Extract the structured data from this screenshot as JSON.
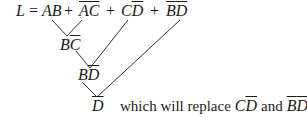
{
  "equation": {
    "lhs": "L",
    "equals": "=",
    "terms": [
      {
        "id": "t1",
        "parts": [
          {
            "v": "A",
            "bar": false
          },
          {
            "v": "B",
            "bar": false
          }
        ]
      },
      {
        "id": "t2",
        "parts": [
          {
            "v": "A",
            "bar": true
          },
          {
            "v": "C",
            "bar": true
          }
        ]
      },
      {
        "id": "t3",
        "parts": [
          {
            "v": "C",
            "bar": false
          },
          {
            "v": "D",
            "bar": true
          }
        ]
      },
      {
        "id": "t4",
        "parts": [
          {
            "v": "B",
            "bar": true
          },
          {
            "v": "D",
            "bar": true
          }
        ]
      }
    ],
    "plus": "+"
  },
  "consensus": [
    {
      "id": "c1",
      "from": [
        "AB",
        "ĀC̄"
      ],
      "parts": [
        {
          "v": "B",
          "bar": false
        },
        {
          "v": "C",
          "bar": true
        }
      ]
    },
    {
      "id": "c2",
      "from": [
        "BC̄",
        "CD̄"
      ],
      "parts": [
        {
          "v": "B",
          "bar": false
        },
        {
          "v": "D",
          "bar": true
        }
      ]
    },
    {
      "id": "c3",
      "from": [
        "BD̄",
        "B̄D̄"
      ],
      "parts": [
        {
          "v": "D",
          "bar": true
        }
      ]
    }
  ],
  "note": {
    "text_before": "which will replace",
    "term_a": [
      {
        "v": "C",
        "bar": false
      },
      {
        "v": "D",
        "bar": true
      }
    ],
    "conj": "and",
    "term_b": [
      {
        "v": "B",
        "bar": true
      },
      {
        "v": "D",
        "bar": true
      }
    ]
  }
}
